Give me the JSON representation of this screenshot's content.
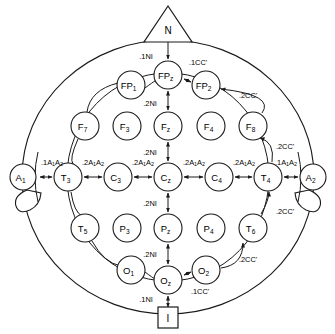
{
  "diagram": {
    "stroke_color": "#1a1a1a",
    "background_color": "#ffffff"
  },
  "landmarks": [
    {
      "id": "nasion",
      "label": "N",
      "shape": "triangle",
      "x": 168,
      "y": 24
    },
    {
      "id": "inion",
      "label": "I",
      "shape": "square",
      "x": 168,
      "y": 318
    }
  ],
  "ears": [
    {
      "id": "ear-left",
      "side": "left"
    },
    {
      "id": "ear-right",
      "side": "right"
    }
  ],
  "electrodes": [
    {
      "id": "a1",
      "base": "A",
      "sub": "1",
      "x": 23,
      "y": 177,
      "r": 13
    },
    {
      "id": "a2",
      "base": "A",
      "sub": "2",
      "x": 313,
      "y": 177,
      "r": 13
    },
    {
      "id": "fp1",
      "base": "FP",
      "sub": "1",
      "x": 131,
      "y": 85,
      "r": 14
    },
    {
      "id": "fpz",
      "base": "FP",
      "sub": "z",
      "x": 168,
      "y": 75,
      "r": 14
    },
    {
      "id": "fp2",
      "base": "FP",
      "sub": "2",
      "x": 206,
      "y": 85,
      "r": 14
    },
    {
      "id": "f7",
      "base": "F",
      "sub": "7",
      "x": 85,
      "y": 126,
      "r": 14
    },
    {
      "id": "f3",
      "base": "F",
      "sub": "3",
      "x": 127,
      "y": 126,
      "r": 14
    },
    {
      "id": "fz",
      "base": "F",
      "sub": "z",
      "x": 168,
      "y": 126,
      "r": 14
    },
    {
      "id": "f4",
      "base": "F",
      "sub": "4",
      "x": 211,
      "y": 126,
      "r": 14
    },
    {
      "id": "f8",
      "base": "F",
      "sub": "8",
      "x": 253,
      "y": 126,
      "r": 14
    },
    {
      "id": "t3",
      "base": "T",
      "sub": "3",
      "x": 68,
      "y": 177,
      "r": 14
    },
    {
      "id": "c3",
      "base": "C",
      "sub": "3",
      "x": 118,
      "y": 177,
      "r": 14
    },
    {
      "id": "cz",
      "base": "C",
      "sub": "z",
      "x": 168,
      "y": 177,
      "r": 14
    },
    {
      "id": "c4",
      "base": "C",
      "sub": "4",
      "x": 219,
      "y": 177,
      "r": 14
    },
    {
      "id": "t4",
      "base": "T",
      "sub": "4",
      "x": 268,
      "y": 177,
      "r": 14
    },
    {
      "id": "t5",
      "base": "T",
      "sub": "5",
      "x": 85,
      "y": 228,
      "r": 14
    },
    {
      "id": "p3",
      "base": "P",
      "sub": "3",
      "x": 127,
      "y": 228,
      "r": 14
    },
    {
      "id": "pz",
      "base": "P",
      "sub": "z",
      "x": 168,
      "y": 228,
      "r": 14
    },
    {
      "id": "p4",
      "base": "P",
      "sub": "4",
      "x": 211,
      "y": 228,
      "r": 14
    },
    {
      "id": "t6",
      "base": "T",
      "sub": "6",
      "x": 253,
      "y": 228,
      "r": 14
    },
    {
      "id": "o1",
      "base": "O",
      "sub": "1",
      "x": 131,
      "y": 270,
      "r": 14
    },
    {
      "id": "oz",
      "base": "O",
      "sub": "z",
      "x": 168,
      "y": 280,
      "r": 14
    },
    {
      "id": "o2",
      "base": "O",
      "sub": "2",
      "x": 206,
      "y": 270,
      "r": 14
    }
  ],
  "distance_labels": [
    {
      "id": "d-nasion-fpz",
      "base": ".1NI",
      "sub": "",
      "x": 146,
      "y": 56
    },
    {
      "id": "d-fpz-fp2",
      "base": ".1CC'",
      "sub": "",
      "x": 198,
      "y": 62
    },
    {
      "id": "d-fp2-f8",
      "base": ".2CC'",
      "sub": "",
      "x": 248,
      "y": 95
    },
    {
      "id": "d-f8-t4",
      "base": ".2CC'",
      "sub": "",
      "x": 285,
      "y": 146
    },
    {
      "id": "d-t4-a2",
      "base": ".1A",
      "sub": "1A2",
      "x": 286,
      "y": 162
    },
    {
      "id": "d-a1-t3",
      "base": ".1A",
      "sub": "1A2",
      "x": 52,
      "y": 162
    },
    {
      "id": "d-t3-c3",
      "base": ".2A",
      "sub": "1A2",
      "x": 93,
      "y": 162
    },
    {
      "id": "d-c3-cz",
      "base": ".2A",
      "sub": "1A2",
      "x": 143,
      "y": 162
    },
    {
      "id": "d-cz-c4",
      "base": ".2A",
      "sub": "1A2",
      "x": 194,
      "y": 162
    },
    {
      "id": "d-c4-t4",
      "base": ".2A",
      "sub": "1A2",
      "x": 244,
      "y": 162
    },
    {
      "id": "d-fpz-fz",
      "base": ".2NI",
      "sub": "",
      "x": 150,
      "y": 103
    },
    {
      "id": "d-fz-cz",
      "base": ".2NI",
      "sub": "",
      "x": 150,
      "y": 152
    },
    {
      "id": "d-cz-pz",
      "base": ".2NI",
      "sub": "",
      "x": 150,
      "y": 203
    },
    {
      "id": "d-pz-oz",
      "base": ".2NI",
      "sub": "",
      "x": 150,
      "y": 254
    },
    {
      "id": "d-oz-inion",
      "base": ".1NI",
      "sub": "",
      "x": 146,
      "y": 299
    },
    {
      "id": "d-oz-o2",
      "base": ".1CC'",
      "sub": "",
      "x": 200,
      "y": 291
    },
    {
      "id": "d-o2-t6",
      "base": ".2CC'",
      "sub": "",
      "x": 248,
      "y": 259
    },
    {
      "id": "d-t6-t4",
      "base": ".2CC'",
      "sub": "",
      "x": 285,
      "y": 211
    }
  ]
}
